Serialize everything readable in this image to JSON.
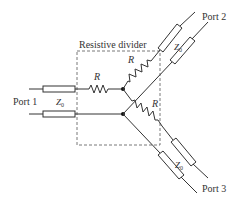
{
  "diagram": {
    "title": "Resistive divider",
    "ports": {
      "port1": "Port 1",
      "port2": "Port 2",
      "port3": "Port 3"
    },
    "impedance_label": {
      "symbol": "Z",
      "subscript": "0"
    },
    "resistor_label": "R",
    "components": [
      {
        "type": "transmission-line",
        "label": "Z0",
        "port": "Port 1"
      },
      {
        "type": "transmission-line",
        "label": "Z0",
        "port": "Port 2"
      },
      {
        "type": "transmission-line",
        "label": "Z0",
        "port": "Port 3"
      },
      {
        "type": "resistor",
        "label": "R",
        "branch": "Port 1"
      },
      {
        "type": "resistor",
        "label": "R",
        "branch": "Port 2"
      },
      {
        "type": "resistor",
        "label": "R",
        "branch": "Port 3"
      }
    ],
    "colors": {
      "line": "#333333",
      "background": "#ffffff"
    }
  }
}
